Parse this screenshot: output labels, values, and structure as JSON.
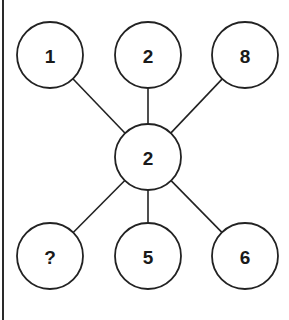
{
  "puzzle": {
    "title": "Number star puzzle",
    "center": {
      "id": "center",
      "label": "2",
      "cx": 148,
      "cy": 157
    },
    "radius": 33,
    "nodes": [
      {
        "id": "top-left",
        "label": "1",
        "cx": 50,
        "cy": 55
      },
      {
        "id": "top-middle",
        "label": "2",
        "cx": 148,
        "cy": 55
      },
      {
        "id": "top-right",
        "label": "8",
        "cx": 245,
        "cy": 55
      },
      {
        "id": "bottom-left",
        "label": "?",
        "cx": 50,
        "cy": 256
      },
      {
        "id": "bottom-middle",
        "label": "5",
        "cx": 148,
        "cy": 256
      },
      {
        "id": "bottom-right",
        "label": "6",
        "cx": 245,
        "cy": 256
      }
    ],
    "edges": [
      {
        "from": "center",
        "to": "top-left"
      },
      {
        "from": "center",
        "to": "top-middle"
      },
      {
        "from": "center",
        "to": "top-right"
      },
      {
        "from": "center",
        "to": "bottom-left"
      },
      {
        "from": "center",
        "to": "bottom-middle"
      },
      {
        "from": "center",
        "to": "bottom-right"
      }
    ],
    "colors": {
      "stroke": "#222222",
      "text": "#1a1a1a",
      "background": "#ffffff"
    }
  }
}
